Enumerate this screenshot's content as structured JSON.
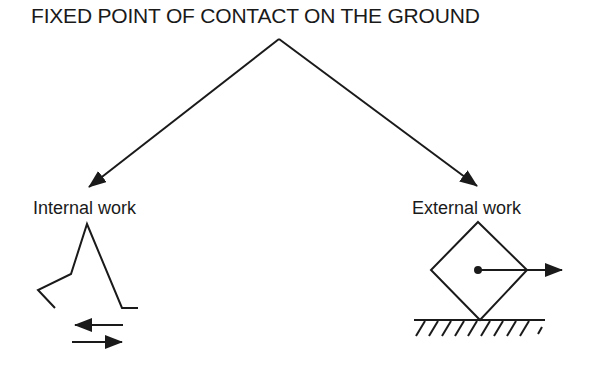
{
  "title": "FIXED POINT OF CONTACT ON THE GROUND",
  "branches": {
    "left": {
      "label": "Internal work"
    },
    "right": {
      "label": "External work"
    }
  },
  "colors": {
    "ink": "#1a1a1a",
    "background": "#ffffff"
  }
}
